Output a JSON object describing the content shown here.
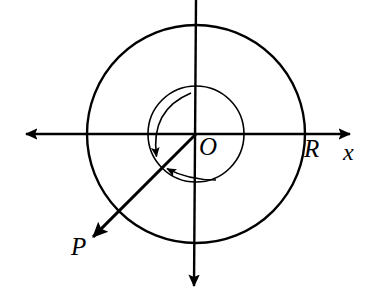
{
  "figure": {
    "kind": "geometry-diagram",
    "width": 367,
    "height": 294,
    "background_color": "#ffffff",
    "stroke_color": "#000000"
  },
  "labels": {
    "origin": "O",
    "radius": "R",
    "x_axis": "x",
    "vector": "P"
  },
  "geometry": {
    "center": {
      "x": 196,
      "y": 134
    },
    "circles": [
      {
        "name": "inner-circle",
        "cx": 196,
        "cy": 134,
        "r": 48,
        "stroke_width": 1.6
      },
      {
        "name": "outer-circle",
        "cx": 196,
        "cy": 134,
        "r": 109,
        "stroke_width": 2.4
      }
    ],
    "axes": {
      "horizontal": {
        "name": "x-axis",
        "x1": 24,
        "y1": 134,
        "x2": 352,
        "y2": 134,
        "stroke_width": 2.4,
        "arrow_left": true,
        "arrow_right": true
      },
      "vertical": {
        "name": "y-axis",
        "x1": 196,
        "y1": 0,
        "x2": 196,
        "y2": 288,
        "stroke_width": 2.4,
        "arrow_top": false,
        "arrow_bottom": true
      }
    },
    "vector_p": {
      "name": "vector-P",
      "x1": 196,
      "y1": 134,
      "x2": 97,
      "y2": 233,
      "stroke_width": 3.0,
      "arrow_at_end": true,
      "angle_degrees_from_positive_x": 225
    },
    "arc_outer": {
      "name": "angle-arc-outer",
      "start": {
        "x": 191,
        "y": 93
      },
      "control": {
        "x": 150,
        "y": 110
      },
      "end": {
        "x": 157,
        "y": 160
      },
      "stroke_width": 1.6,
      "arrow_at_end": true
    },
    "arc_inner": {
      "name": "angle-arc-inner",
      "start": {
        "x": 216,
        "y": 180
      },
      "control": {
        "x": 188,
        "y": 180
      },
      "end": {
        "x": 164,
        "y": 167
      },
      "stroke_width": 1.6,
      "arrow_at_end": true
    }
  }
}
